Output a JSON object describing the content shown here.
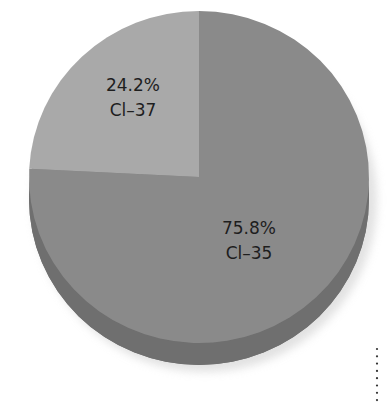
{
  "chart_data": {
    "type": "pie",
    "title": "",
    "style": "3d",
    "slices": [
      {
        "name": "Cl-35",
        "label": "Cl–35",
        "percent_label": "75.8%",
        "value": 75.8,
        "color": "#8a8a8a",
        "side_color": "#6f6f6f"
      },
      {
        "name": "Cl-37",
        "label": "Cl–37",
        "percent_label": "24.2%",
        "value": 24.2,
        "color": "#a9a9a9",
        "side_color": "#8f8f8f"
      }
    ],
    "start_angle_deg": -90,
    "direction": "clockwise"
  }
}
